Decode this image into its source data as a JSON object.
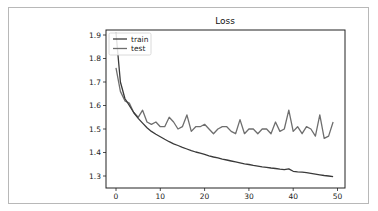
{
  "chart_data": {
    "type": "line",
    "title": "Loss",
    "xlabel": "",
    "ylabel": "",
    "xlim": [
      -2.5,
      51.5
    ],
    "ylim": [
      1.255,
      1.92
    ],
    "xticks": [
      0,
      10,
      20,
      30,
      40,
      50
    ],
    "yticks": [
      1.3,
      1.4,
      1.5,
      1.6,
      1.7,
      1.8,
      1.9
    ],
    "xtick_labels": [
      "0",
      "10",
      "20",
      "30",
      "40",
      "50"
    ],
    "ytick_labels": [
      "1.3",
      "1.4",
      "1.5",
      "1.6",
      "1.7",
      "1.8",
      "1.9"
    ],
    "grid": false,
    "legend_position": "upper left",
    "x": [
      0,
      1,
      2,
      3,
      4,
      5,
      6,
      7,
      8,
      9,
      10,
      11,
      12,
      13,
      14,
      15,
      16,
      17,
      18,
      19,
      20,
      21,
      22,
      23,
      24,
      25,
      26,
      27,
      28,
      29,
      30,
      31,
      32,
      33,
      34,
      35,
      36,
      37,
      38,
      39,
      40,
      41,
      42,
      43,
      44,
      45,
      46,
      47,
      48,
      49
    ],
    "series": [
      {
        "name": "train",
        "color": "#3a3a3a",
        "values": [
          1.91,
          1.7,
          1.63,
          1.6,
          1.57,
          1.545,
          1.525,
          1.505,
          1.49,
          1.478,
          1.467,
          1.456,
          1.446,
          1.437,
          1.43,
          1.422,
          1.415,
          1.408,
          1.402,
          1.397,
          1.392,
          1.386,
          1.381,
          1.377,
          1.372,
          1.368,
          1.364,
          1.36,
          1.356,
          1.352,
          1.349,
          1.345,
          1.342,
          1.339,
          1.337,
          1.334,
          1.332,
          1.329,
          1.327,
          1.33,
          1.32,
          1.318,
          1.316,
          1.314,
          1.311,
          1.308,
          1.305,
          1.302,
          1.3,
          1.297
        ]
      },
      {
        "name": "test",
        "color": "#6e6e6e",
        "values": [
          1.76,
          1.66,
          1.62,
          1.61,
          1.57,
          1.55,
          1.58,
          1.53,
          1.52,
          1.53,
          1.51,
          1.51,
          1.55,
          1.53,
          1.5,
          1.51,
          1.56,
          1.49,
          1.51,
          1.51,
          1.52,
          1.5,
          1.48,
          1.5,
          1.51,
          1.51,
          1.49,
          1.48,
          1.54,
          1.48,
          1.5,
          1.5,
          1.48,
          1.5,
          1.5,
          1.48,
          1.53,
          1.49,
          1.5,
          1.58,
          1.49,
          1.51,
          1.48,
          1.51,
          1.5,
          1.47,
          1.56,
          1.46,
          1.47,
          1.53
        ]
      }
    ]
  },
  "legend": {
    "items": [
      {
        "label": "train",
        "color": "#3a3a3a"
      },
      {
        "label": "test",
        "color": "#6e6e6e"
      }
    ]
  }
}
